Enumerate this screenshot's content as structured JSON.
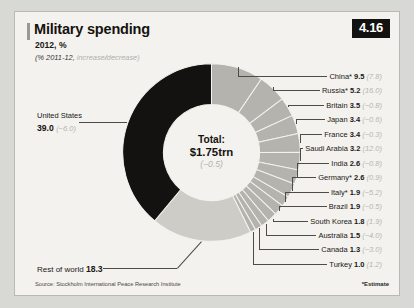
{
  "figure": {
    "badge": "4.16",
    "title": "Military spending",
    "subtitle": "2012, %",
    "subnote_prefix": "(% 2011-12,",
    "subnote_increase": "increase",
    "subnote_sep": "/",
    "subnote_decrease": "decrease",
    "subnote_suffix": ")",
    "source": "Source: Stockholm International Peace Research Institute",
    "estimate_note": "*Estimate",
    "colors": {
      "page_background": "#d8d8d4",
      "panel_background": "#f3f2ee",
      "panel_border": "#b9b8b3",
      "united_states": "#141210",
      "country_segment": "#b4b3ae",
      "rest_of_world": "#cdccc7",
      "segment_gap": "#f3f2ee",
      "text": "#1b1815",
      "muted_text": "#b6b4af",
      "leader_line": "#4f4c48",
      "badge_background": "#141210",
      "badge_text": "#ffffff"
    }
  },
  "center": {
    "line1": "Total:",
    "line2": "$1.75trn",
    "line3": "(−0.5)"
  },
  "chart_data": {
    "type": "pie",
    "variant": "donut",
    "title": "Military spending",
    "subtitle": "2012, %",
    "annotation": "(% 2011-12, increase/decrease)",
    "unit": "% of world total",
    "total_label": "Total: $1.75trn",
    "total_change": "(−0.5)",
    "legend": "none",
    "grid": false,
    "change_unit": "% change 2011-12",
    "slices": [
      {
        "label": "China*",
        "name": "China",
        "value": 9.5,
        "change": "(7.8)",
        "change_value": 7.8,
        "estimate": true,
        "color": "#b4b3ae"
      },
      {
        "label": "Russia*",
        "name": "Russia",
        "value": 5.2,
        "change": "(16.0)",
        "change_value": 16.0,
        "estimate": true,
        "color": "#b4b3ae"
      },
      {
        "label": "Britain",
        "name": "Britain",
        "value": 3.5,
        "change": "(−0.8)",
        "change_value": -0.8,
        "estimate": false,
        "color": "#b4b3ae"
      },
      {
        "label": "Japan",
        "name": "Japan",
        "value": 3.4,
        "change": "(−0.6)",
        "change_value": -0.6,
        "estimate": false,
        "color": "#b4b3ae"
      },
      {
        "label": "France",
        "name": "France",
        "value": 3.4,
        "change": "(−0.3)",
        "change_value": -0.3,
        "estimate": false,
        "color": "#b4b3ae"
      },
      {
        "label": "Saudi Arabia",
        "name": "Saudi Arabia",
        "value": 3.2,
        "change": "(12.0)",
        "change_value": 12.0,
        "estimate": false,
        "color": "#b4b3ae"
      },
      {
        "label": "India",
        "name": "India",
        "value": 2.6,
        "change": "(−0.8)",
        "change_value": -0.8,
        "estimate": false,
        "color": "#b4b3ae"
      },
      {
        "label": "Germany*",
        "name": "Germany",
        "value": 2.6,
        "change": "(0.9)",
        "change_value": 0.9,
        "estimate": true,
        "color": "#b4b3ae"
      },
      {
        "label": "Italy*",
        "name": "Italy",
        "value": 1.9,
        "change": "(−5.2)",
        "change_value": -5.2,
        "estimate": true,
        "color": "#b4b3ae"
      },
      {
        "label": "Brazil",
        "name": "Brazil",
        "value": 1.9,
        "change": "(−0.5)",
        "change_value": -0.5,
        "estimate": false,
        "color": "#b4b3ae"
      },
      {
        "label": "South Korea",
        "name": "South Korea",
        "value": 1.8,
        "change": "(1.9)",
        "change_value": 1.9,
        "estimate": false,
        "color": "#b4b3ae"
      },
      {
        "label": "Australia",
        "name": "Australia",
        "value": 1.5,
        "change": "(−4.0)",
        "change_value": -4.0,
        "estimate": false,
        "color": "#b4b3ae"
      },
      {
        "label": "Canada",
        "name": "Canada",
        "value": 1.3,
        "change": "(−3.0)",
        "change_value": -3.0,
        "estimate": false,
        "color": "#b4b3ae"
      },
      {
        "label": "Turkey",
        "name": "Turkey",
        "value": 1.0,
        "change": "(1.2)",
        "change_value": 1.2,
        "estimate": false,
        "color": "#b4b3ae"
      },
      {
        "label": "Rest of world",
        "name": "Rest of world",
        "value": 18.3,
        "change": "",
        "change_value": null,
        "estimate": false,
        "color": "#cdccc7"
      },
      {
        "label": "United States",
        "name": "United States",
        "value": 39.0,
        "change": "(−6.0)",
        "change_value": -6.0,
        "estimate": false,
        "color": "#141210"
      }
    ],
    "source": "Source: Stockholm International Peace Research Institute",
    "footnote": "*Estimate"
  },
  "labels": {
    "united_states": {
      "name": "United States",
      "value": "39.0",
      "change": "(−6.0)"
    },
    "rest_of_world": {
      "name": "Rest of world",
      "value": "18.3"
    },
    "right": [
      {
        "name": "China*",
        "value": "9.5",
        "change": "(7.8)"
      },
      {
        "name": "Russia*",
        "value": "5.2",
        "change": "(16.0)"
      },
      {
        "name": "Britain",
        "value": "3.5",
        "change": "(−0.8)"
      },
      {
        "name": "Japan",
        "value": "3.4",
        "change": "(−0.6)"
      },
      {
        "name": "France",
        "value": "3.4",
        "change": "(−0.3)"
      },
      {
        "name": "Saudi Arabia",
        "value": "3.2",
        "change": "(12.0)"
      },
      {
        "name": "India",
        "value": "2.6",
        "change": "(−0.8)"
      },
      {
        "name": "Germany*",
        "value": "2.6",
        "change": "(0.9)"
      },
      {
        "name": "Italy*",
        "value": "1.9",
        "change": "(−5.2)"
      },
      {
        "name": "Brazil",
        "value": "1.9",
        "change": "(−0.5)"
      },
      {
        "name": "South Korea",
        "value": "1.8",
        "change": "(1.9)"
      },
      {
        "name": "Australia",
        "value": "1.5",
        "change": "(−4.0)"
      },
      {
        "name": "Canada",
        "value": "1.3",
        "change": "(−3.0)"
      },
      {
        "name": "Turkey",
        "value": "1.0",
        "change": "(1.2)"
      }
    ]
  }
}
